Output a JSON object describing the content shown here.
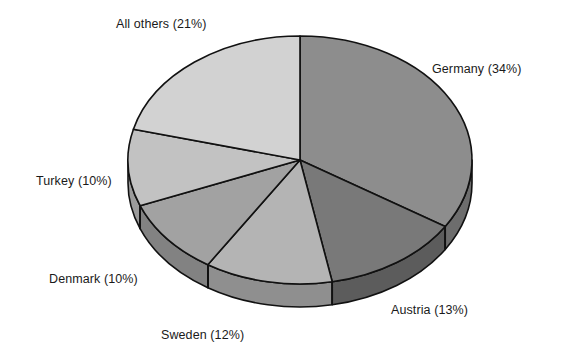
{
  "chart_data": {
    "type": "pie",
    "title": "",
    "subtitle": "",
    "xlabel": "",
    "ylabel": "",
    "legend_position": "none",
    "grid": false,
    "three_d": true,
    "start_angle_deg": 0,
    "direction": "clockwise",
    "units": "percent",
    "categories": [
      "Germany",
      "Austria",
      "Sweden",
      "Denmark",
      "Turkey",
      "All others"
    ],
    "values": [
      34,
      13,
      12,
      10,
      10,
      21
    ],
    "labels": [
      "Germany (34%)",
      "Austria (13%)",
      "Sweden (12%)",
      "Denmark (10%)",
      "Turkey (10%)",
      "All others (21%)"
    ],
    "slices": [
      {
        "name": "Germany",
        "value": 34,
        "label": "Germany (34%)",
        "top_color": "#8d8d8d",
        "side_color": "#6d6d6d"
      },
      {
        "name": "Austria",
        "value": 13,
        "label": "Austria (13%)",
        "top_color": "#797979",
        "side_color": "#5c5c5c"
      },
      {
        "name": "Sweden",
        "value": 12,
        "label": "Sweden (12%)",
        "top_color": "#b4b4b4",
        "side_color": "#8f8f8f"
      },
      {
        "name": "Denmark",
        "value": 10,
        "label": "Denmark (10%)",
        "top_color": "#a2a2a2",
        "side_color": "#828282"
      },
      {
        "name": "Turkey",
        "value": 10,
        "label": "Turkey (10%)",
        "top_color": "#c2c2c2",
        "side_color": "#9b9b9b"
      },
      {
        "name": "All others",
        "value": 21,
        "label": "All others (21%)",
        "top_color": "#d2d2d2",
        "side_color": "#a8a8a8"
      }
    ],
    "outline_color": "#111111",
    "background_color": "#ffffff"
  },
  "labels": {
    "germany": "Germany (34%)",
    "austria": "Austria (13%)",
    "sweden": "Sweden (12%)",
    "denmark": "Denmark (10%)",
    "turkey": "Turkey (10%)",
    "all_others": "All others (21%)"
  }
}
